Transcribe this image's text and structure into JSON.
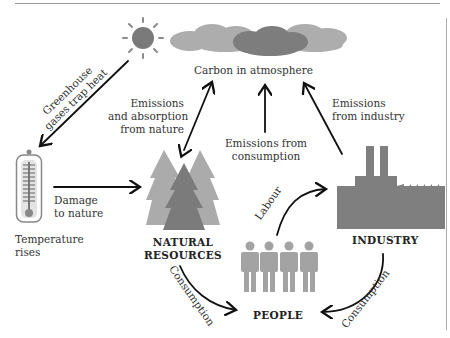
{
  "diagram": {
    "title_node": "Carbon in atmosphere",
    "nodes": {
      "natural_resources": [
        "NATURAL",
        "RESOURCES"
      ],
      "industry": "INDUSTRY",
      "people": "PEOPLE",
      "temperature": [
        "Temperature",
        "rises"
      ]
    },
    "edge_labels": {
      "greenhouse": [
        "Greenhouse",
        "gases trap heat"
      ],
      "emissions_nature": [
        "Emissions",
        "and absorption",
        "from nature"
      ],
      "emissions_consumption": [
        "Emissions from",
        "consumption"
      ],
      "emissions_industry": [
        "Emissions",
        "from industry"
      ],
      "damage": [
        "Damage",
        "to nature"
      ],
      "labour": "Labour",
      "consumption_left": "Consumption",
      "consumption_right": "Consumption"
    },
    "icons": [
      "sun-icon",
      "cloud-icon",
      "thermometer-icon",
      "trees-icon",
      "factory-icon",
      "people-icon"
    ],
    "colors": {
      "cloud_light": "#a9a9a9",
      "cloud_dark": "#7c7c7c",
      "sun": "#7a7a7a",
      "factory": "#7f7f7f",
      "people": "#a3a3a3",
      "tree_light": "#a8a8a8",
      "tree_dark": "#7a7a7a"
    }
  }
}
